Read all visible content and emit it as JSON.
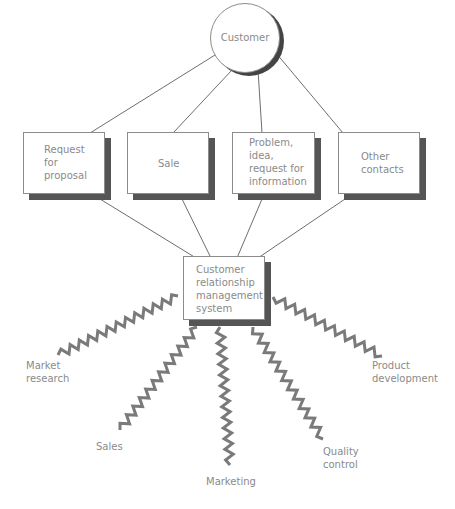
{
  "hub": {
    "label": "Customer"
  },
  "channels": [
    {
      "id": "request",
      "lines": [
        "Request",
        "for",
        "proposal"
      ]
    },
    {
      "id": "sale",
      "lines": [
        "Sale"
      ]
    },
    {
      "id": "problem",
      "lines": [
        "Problem,",
        "idea,",
        "request for",
        "information"
      ]
    },
    {
      "id": "other",
      "lines": [
        "Other",
        "contacts"
      ]
    }
  ],
  "system": {
    "lines": [
      "Customer",
      "relationship",
      "management",
      "system"
    ]
  },
  "outputs": [
    {
      "id": "market-research",
      "lines": [
        "Market",
        "research"
      ]
    },
    {
      "id": "sales",
      "lines": [
        "Sales"
      ]
    },
    {
      "id": "marketing",
      "lines": [
        "Marketing"
      ]
    },
    {
      "id": "quality-control",
      "lines": [
        "Quality",
        "control"
      ]
    },
    {
      "id": "product-development",
      "lines": [
        "Product",
        "development"
      ]
    }
  ],
  "colors": {
    "line": "#6e6e6e",
    "shadow": "#555555",
    "text": "#8a8a8a",
    "zigzag": "#7a7a7a"
  }
}
